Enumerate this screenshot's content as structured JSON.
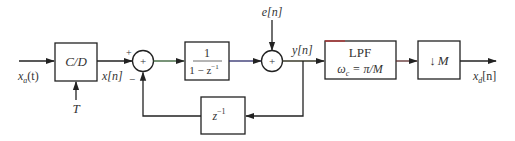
{
  "diagram": {
    "type": "block-diagram",
    "blocks": {
      "cd": {
        "label": "C/D"
      },
      "accumulator": {
        "numerator": "1",
        "denominator": "1 − z",
        "exponent": "−1"
      },
      "delay": {
        "label": "z",
        "exponent": "−1"
      },
      "lpf": {
        "line1": "LPF",
        "line2_prefix": "ω",
        "line2_sub": "c",
        "line2_suffix": " = π/M"
      },
      "downsampler": {
        "arrow": "↓",
        "label": "M"
      }
    },
    "signals": {
      "input": {
        "base": "x",
        "sub": "a",
        "arg": "(t)"
      },
      "sampling_period": "T",
      "sampled": "x[n]",
      "noise": "e[n]",
      "accum_out": "y[n]",
      "output": {
        "base": "x",
        "sub": "d",
        "arg": "[n]"
      }
    },
    "summers": {
      "sum1": {
        "symbol": "+",
        "plus_sign": "+",
        "minus_sign": "−"
      },
      "sum2": {
        "symbol": "+"
      }
    }
  }
}
